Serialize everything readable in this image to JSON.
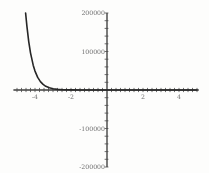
{
  "colors": {
    "background": "#fdfdfc",
    "axis": "#3c3c3c",
    "tick": "#4a4a4a",
    "label": "#6e6e6e",
    "curve": "#262626"
  },
  "chart_data": {
    "type": "line",
    "title": "",
    "xlabel": "",
    "ylabel": "",
    "grid": false,
    "legend": null,
    "xlim": [
      -5.2,
      5.1
    ],
    "ylim": [
      -200000,
      200000
    ],
    "x_tick_range": [
      -5,
      5
    ],
    "x_minor_step": 0.25,
    "y_tick_range": [
      -200000,
      200000
    ],
    "y_minor_step": 20000,
    "x_major_ticks": [
      {
        "value": -4,
        "label": "-4"
      },
      {
        "value": -2,
        "label": "-2"
      },
      {
        "value": 2,
        "label": "2"
      },
      {
        "value": 4,
        "label": "4"
      }
    ],
    "y_major_ticks": [
      {
        "value": 200000,
        "label": "200000"
      },
      {
        "value": 100000,
        "label": "100000"
      },
      {
        "value": -100000,
        "label": "-100000"
      },
      {
        "value": -200000,
        "label": "-200000"
      }
    ],
    "series": [
      {
        "name": "exponential-decay-curve",
        "points": [
          [
            -4.52,
            200000
          ],
          [
            -4.45,
            165800
          ],
          [
            -4.35,
            126500
          ],
          [
            -4.25,
            96600
          ],
          [
            -4.1,
            64300
          ],
          [
            -4.0,
            49000
          ],
          [
            -3.85,
            32700
          ],
          [
            -3.7,
            21800
          ],
          [
            -3.55,
            14550
          ],
          [
            -3.4,
            9700
          ],
          [
            -3.2,
            5660
          ],
          [
            -3.0,
            3300
          ],
          [
            -2.75,
            1680
          ],
          [
            -2.5,
            860
          ],
          [
            -2.0,
            220
          ],
          [
            -1.5,
            57
          ],
          [
            -1.0,
            15
          ],
          [
            0.0,
            1
          ],
          [
            1.0,
            0
          ],
          [
            2.0,
            0
          ],
          [
            3.0,
            0
          ],
          [
            4.0,
            0
          ],
          [
            5.0,
            0
          ]
        ]
      }
    ]
  }
}
